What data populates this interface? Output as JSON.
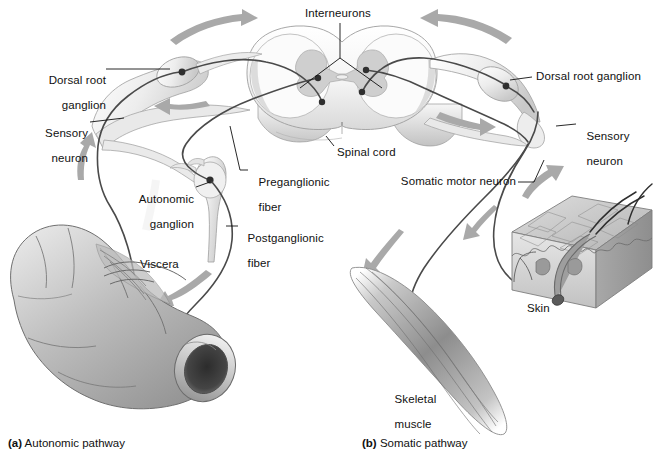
{
  "figure": {
    "background_color": "#ffffff",
    "ink_color": "#111111",
    "arrow_color": "#a9a9a9",
    "nerve_color": "#4a4a4a",
    "tissue_fill": "#f2f2f2"
  },
  "labels": {
    "interneurons": "Interneurons",
    "dorsal_root_ganglion_left_line1": "Dorsal root",
    "dorsal_root_ganglion_left_line2": "ganglion",
    "sensory_neuron_left_line1": "Sensory",
    "sensory_neuron_left_line2": "neuron",
    "preganglionic_fiber_line1": "Preganglionic",
    "preganglionic_fiber_line2": "fiber",
    "autonomic_ganglion_line1": "Autonomic",
    "autonomic_ganglion_line2": "ganglion",
    "postganglionic_fiber_line1": "Postganglionic",
    "postganglionic_fiber_line2": "fiber",
    "spinal_cord": "Spinal cord",
    "viscera": "Viscera",
    "dorsal_root_ganglion_right": "Dorsal root ganglion",
    "sensory_neuron_right_line1": "Sensory",
    "sensory_neuron_right_line2": "neuron",
    "somatic_motor_neuron": "Somatic motor neuron",
    "skin": "Skin",
    "skeletal_muscle_line1": "Skeletal",
    "skeletal_muscle_line2": "muscle"
  },
  "captions": {
    "panel_a_tag": "(a)",
    "panel_a_text": " Autonomic pathway",
    "panel_b_tag": "(b)",
    "panel_b_text": " Somatic pathway"
  }
}
